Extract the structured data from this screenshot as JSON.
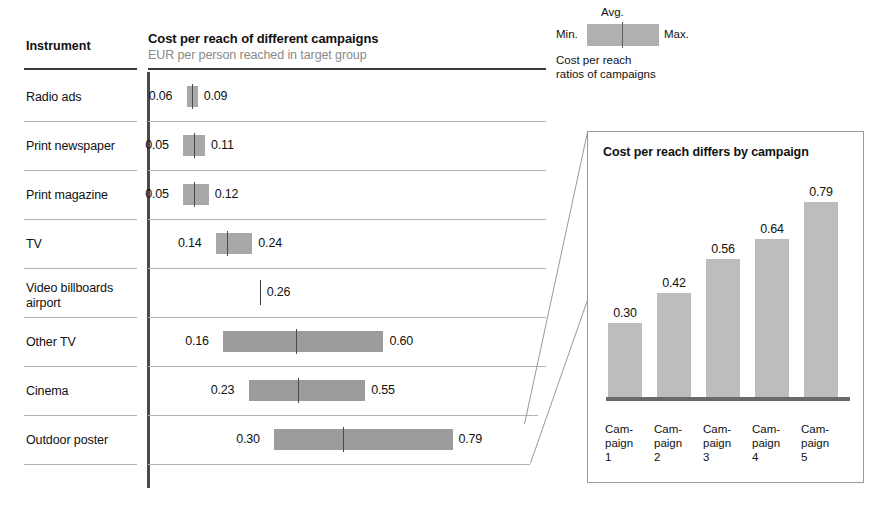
{
  "range_chart": {
    "instrument_header": "Instrument",
    "title": "Cost per reach of different campaigns",
    "subtitle": "EUR per person reached in target group",
    "rows": [
      {
        "label": "Radio ads",
        "min": 0.06,
        "max": 0.09,
        "avg": 0.075,
        "min_text": "0.06",
        "max_text": "0.09"
      },
      {
        "label": "Print newspaper",
        "min": 0.05,
        "max": 0.11,
        "avg": 0.08,
        "min_text": "0.05",
        "max_text": "0.11"
      },
      {
        "label": "Print magazine",
        "min": 0.05,
        "max": 0.12,
        "avg": 0.08,
        "min_text": "0.05",
        "max_text": "0.12"
      },
      {
        "label": "TV",
        "min": 0.14,
        "max": 0.24,
        "avg": 0.17,
        "min_text": "0.14",
        "max_text": "0.24"
      },
      {
        "label": "Video billboards\nairport",
        "min": 0.26,
        "max": 0.26,
        "avg": 0.26,
        "min_text": "",
        "max_text": "0.26"
      },
      {
        "label": "Other TV",
        "min": 0.16,
        "max": 0.6,
        "avg": 0.36,
        "min_text": "0.16",
        "max_text": "0.60"
      },
      {
        "label": "Cinema",
        "min": 0.23,
        "max": 0.55,
        "avg": 0.365,
        "min_text": "0.23",
        "max_text": "0.55"
      },
      {
        "label": "Outdoor poster",
        "min": 0.3,
        "max": 0.79,
        "avg": 0.49,
        "min_text": "0.30",
        "max_text": "0.79"
      }
    ]
  },
  "legend": {
    "avg_label": "Avg.",
    "min_label": "Min.",
    "max_label": "Max.",
    "caption_line1": "Cost per reach",
    "caption_line2": "ratios of campaigns"
  },
  "callout": {
    "title": "Cost per reach differs by campaign"
  },
  "chart_data": [
    {
      "type": "bar",
      "id": "range-bars",
      "title": "Cost per reach of different campaigns",
      "subtitle": "EUR per person reached in target group",
      "xlabel": "",
      "ylabel": "Instrument",
      "unit": "EUR per person reached in target group",
      "orientation": "horizontal",
      "encoding": "min-avg-max range bars",
      "xlim": [
        0,
        0.85
      ],
      "grid": false,
      "legend": {
        "position": "top-right",
        "entries": [
          "Min.",
          "Avg.",
          "Max."
        ]
      },
      "categories": [
        "Radio ads",
        "Print newspaper",
        "Print magazine",
        "TV",
        "Video billboards airport",
        "Other TV",
        "Cinema",
        "Outdoor poster"
      ],
      "series": [
        {
          "name": "Min.",
          "values": [
            0.06,
            0.05,
            0.05,
            0.14,
            0.26,
            0.16,
            0.23,
            0.3
          ]
        },
        {
          "name": "Max.",
          "values": [
            0.09,
            0.11,
            0.12,
            0.24,
            0.26,
            0.6,
            0.55,
            0.79
          ]
        }
      ]
    },
    {
      "type": "bar",
      "id": "campaign-bars",
      "title": "Cost per reach differs by campaign",
      "xlabel": "",
      "ylabel": "",
      "ylim": [
        0,
        0.85
      ],
      "grid": false,
      "categories": [
        "Cam-paign 1",
        "Cam-paign 2",
        "Cam-paign 3",
        "Cam-paign 4",
        "Cam-paign 5"
      ],
      "category_lines": [
        [
          "Cam-",
          "paign",
          "1"
        ],
        [
          "Cam-",
          "paign",
          "2"
        ],
        [
          "Cam-",
          "paign",
          "3"
        ],
        [
          "Cam-",
          "paign",
          "4"
        ],
        [
          "Cam-",
          "paign",
          "5"
        ]
      ],
      "values": [
        0.3,
        0.42,
        0.56,
        0.64,
        0.79
      ],
      "value_labels": [
        "0.30",
        "0.42",
        "0.56",
        "0.64",
        "0.79"
      ]
    }
  ],
  "colors": {
    "bar_fill": "#b0b0b0",
    "bar_fill_dark": "#9c9c9c",
    "callout_bar_fill": "#bdbdbd",
    "axis": "#4a4a4a",
    "separator": "#b4b4b4",
    "subtitle_text": "#8a8a8a",
    "text": "#111111",
    "background": "#ffffff"
  }
}
